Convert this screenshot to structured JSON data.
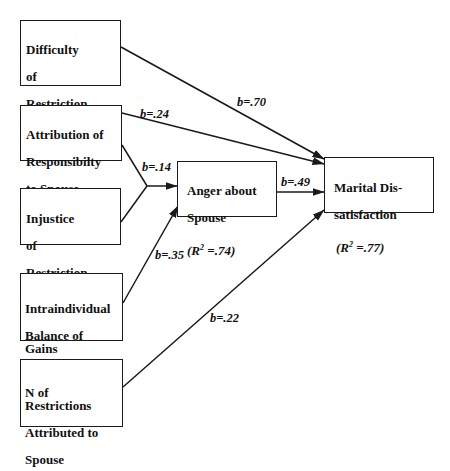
{
  "diagram": {
    "type": "path-model",
    "colors": {
      "line": "#1a1a1a",
      "background": "#ffffff"
    },
    "nodes": {
      "difficulty": {
        "lines": [
          "Difficulty",
          "of",
          "Restriction"
        ]
      },
      "attribution": {
        "lines": [
          "Attribution of",
          "Responsibilty",
          "to Spouse"
        ]
      },
      "injustice": {
        "lines": [
          "Injustice",
          "of",
          "Restriction"
        ]
      },
      "balance": {
        "lines": [
          "Intraindividual",
          "Balance of Gains",
          "& Losses (-)"
        ]
      },
      "n_restrictions": {
        "lines": [
          "N of Restrictions",
          "Attributed to",
          "Spouse"
        ]
      },
      "anger": {
        "lines": [
          "Anger about",
          "Spouse"
        ],
        "r2_prefix": "(R",
        "r2_sup": "2",
        "r2_value": " =.74)"
      },
      "marital": {
        "lines": [
          "Marital Dis-",
          "satisfaction"
        ],
        "r2_prefix": "(R",
        "r2_sup": "2",
        "r2_value": " =.77)"
      }
    },
    "edges": [
      {
        "from": "difficulty",
        "to": "marital",
        "label": "b=.70"
      },
      {
        "from": "attribution",
        "to": "marital",
        "label": "b=.24"
      },
      {
        "from": "attribution+injustice",
        "to": "anger",
        "label": "b=.14"
      },
      {
        "from": "anger",
        "to": "marital",
        "label": "b=.49"
      },
      {
        "from": "balance",
        "to": "anger",
        "label": "b=.35"
      },
      {
        "from": "n_restrictions",
        "to": "marital",
        "label": "b=.22"
      }
    ]
  }
}
